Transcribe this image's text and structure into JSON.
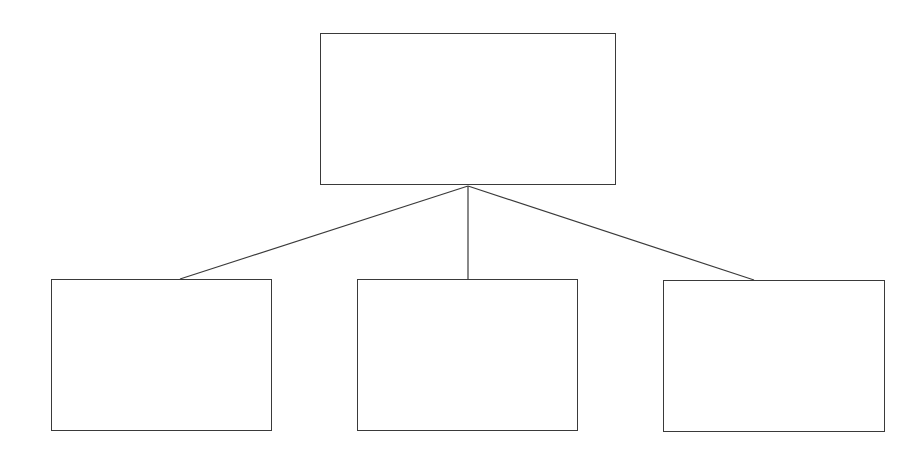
{
  "diagram": {
    "type": "hierarchy",
    "stroke_color": "#3a3a3a",
    "background": "#ffffff",
    "root": {
      "id": "root",
      "label": "",
      "box": {
        "x": 320,
        "y": 33,
        "w": 296,
        "h": 152
      }
    },
    "children": [
      {
        "id": "child-left",
        "label": "",
        "box": {
          "x": 51,
          "y": 279,
          "w": 221,
          "h": 152
        }
      },
      {
        "id": "child-middle",
        "label": "",
        "box": {
          "x": 357,
          "y": 279,
          "w": 221,
          "h": 152
        }
      },
      {
        "id": "child-right",
        "label": "",
        "box": {
          "x": 663,
          "y": 280,
          "w": 222,
          "h": 152
        }
      }
    ],
    "junction": {
      "x": 468,
      "y": 186
    },
    "connectors": [
      {
        "from": "root",
        "to": "child-left",
        "x1": 468,
        "y1": 186,
        "x2": 180,
        "y2": 279
      },
      {
        "from": "root",
        "to": "child-middle",
        "x1": 468,
        "y1": 186,
        "x2": 468,
        "y2": 279
      },
      {
        "from": "root",
        "to": "child-right",
        "x1": 468,
        "y1": 186,
        "x2": 754,
        "y2": 280
      }
    ]
  }
}
